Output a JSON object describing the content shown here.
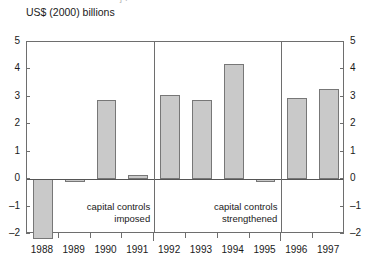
{
  "crop_strip_text": "j      r",
  "chart_data": {
    "type": "bar",
    "title": "",
    "subtitle": "",
    "ylabel": "US$ (2000) billions",
    "xlabel": "",
    "categories": [
      "1988",
      "1989",
      "1990",
      "1991",
      "1992",
      "1993",
      "1994",
      "1995",
      "1996",
      "1997"
    ],
    "values": [
      -2.2,
      -0.12,
      2.9,
      0.15,
      3.05,
      2.87,
      4.2,
      -0.08,
      2.95,
      3.3
    ],
    "ylim": [
      -2,
      5
    ],
    "y_ticks": [
      5,
      4,
      3,
      2,
      1,
      0,
      -1,
      -2
    ],
    "y_tick_labels_left": [
      "5",
      "4",
      "3",
      "2",
      "1",
      "0",
      "–1",
      "–2"
    ],
    "y_tick_labels_right": [
      "5",
      "4",
      "3",
      "2",
      "1",
      "0",
      "–1",
      "–2"
    ],
    "grid": false,
    "legend": "none",
    "bar_fill": "#c9c9c9",
    "bar_stroke": "#777777",
    "axis_color": "#6e6e6e",
    "annotations": [
      {
        "text": "capital controls\nimposed",
        "after_category": "1991"
      },
      {
        "text": "capital controls\nstrengthened",
        "after_category": "1995"
      }
    ],
    "separators_after": [
      "1991",
      "1995"
    ]
  }
}
